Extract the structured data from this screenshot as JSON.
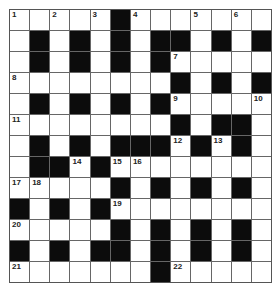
{
  "puzzle": {
    "rows": 13,
    "cols": 13,
    "grid": [
      "WWWWWBWWWWWWW",
      "WBWBWBWBBWBWB",
      "WBWBWBWBWWWWW",
      "WWWWWWWWBWBWB",
      "WBWBWBWBWWWWW",
      "WWWWWWWWBWBBW",
      "WBWBWBBBWBWBW",
      "WBBWBWWWWWWWW",
      "WWWWWBWBWBWBW",
      "BWBWBWWWWWWWW",
      "WWWWWBWBWBWBW",
      "BWBWBBWBWBWBW",
      "WWWWWWWBWWWWW"
    ],
    "numbers": [
      {
        "r": 0,
        "c": 0,
        "n": "1"
      },
      {
        "r": 0,
        "c": 2,
        "n": "2"
      },
      {
        "r": 0,
        "c": 4,
        "n": "3"
      },
      {
        "r": 0,
        "c": 6,
        "n": "4"
      },
      {
        "r": 0,
        "c": 9,
        "n": "5"
      },
      {
        "r": 0,
        "c": 11,
        "n": "6"
      },
      {
        "r": 2,
        "c": 8,
        "n": "7"
      },
      {
        "r": 3,
        "c": 0,
        "n": "8"
      },
      {
        "r": 4,
        "c": 8,
        "n": "9"
      },
      {
        "r": 4,
        "c": 12,
        "n": "10"
      },
      {
        "r": 5,
        "c": 0,
        "n": "11"
      },
      {
        "r": 6,
        "c": 8,
        "n": "12"
      },
      {
        "r": 6,
        "c": 10,
        "n": "13"
      },
      {
        "r": 7,
        "c": 3,
        "n": "14"
      },
      {
        "r": 7,
        "c": 5,
        "n": "15"
      },
      {
        "r": 7,
        "c": 6,
        "n": "16"
      },
      {
        "r": 8,
        "c": 0,
        "n": "17"
      },
      {
        "r": 8,
        "c": 1,
        "n": "18"
      },
      {
        "r": 9,
        "c": 5,
        "n": "19"
      },
      {
        "r": 10,
        "c": 0,
        "n": "20"
      },
      {
        "r": 12,
        "c": 0,
        "n": "21"
      },
      {
        "r": 12,
        "c": 8,
        "n": "22"
      }
    ],
    "colors": {
      "white": "#ffffff",
      "black": "#0c0c0c",
      "line": "#666666"
    }
  }
}
